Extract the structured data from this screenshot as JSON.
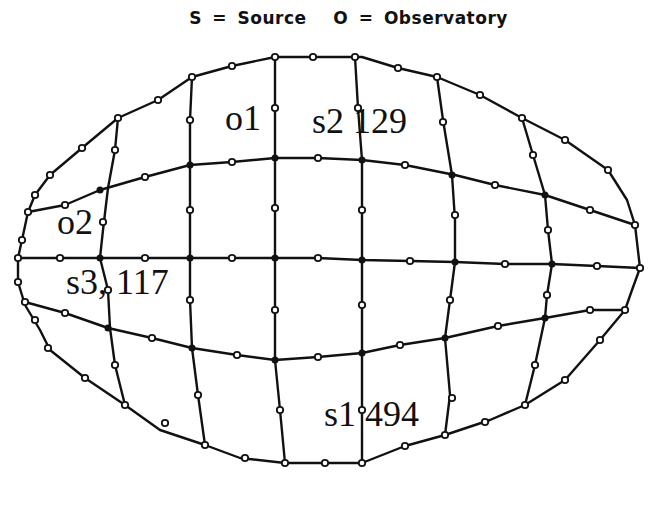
{
  "title": {
    "source_symbol": "S",
    "source_label": "Source",
    "observatory_symbol": "O",
    "observatory_label": "Observatory",
    "equals": "="
  },
  "labels": {
    "o1": "o1",
    "s2": "s2 129",
    "o2": "o2",
    "s3": "s3, 117",
    "s1": "s1 494"
  },
  "style": {
    "line_color": "#111111",
    "node_fill": "#ffffff",
    "background": "#ffffff"
  }
}
